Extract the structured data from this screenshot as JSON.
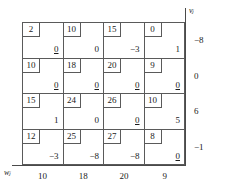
{
  "figure": {
    "type": "transportation-tableau",
    "rows": 4,
    "columns": 4
  },
  "axes": {
    "v_label": "vⱼ",
    "w_label": "wⱼ"
  },
  "chart_data": {
    "type": "table",
    "title": "",
    "xlabel": "wⱼ",
    "ylabel": "vⱼ",
    "grid": true,
    "legend": "none",
    "costs": [
      [
        2,
        10,
        15,
        0
      ],
      [
        10,
        18,
        20,
        9
      ],
      [
        15,
        24,
        26,
        10
      ],
      [
        12,
        25,
        27,
        8
      ]
    ],
    "values": [
      [
        "0",
        "0",
        "−3",
        "1"
      ],
      [
        "0",
        "0",
        "0",
        "0"
      ],
      [
        "1",
        "0",
        "0",
        "5"
      ],
      [
        "−3",
        "−8",
        "−8",
        "0"
      ]
    ],
    "basic": [
      [
        true,
        false,
        false,
        false
      ],
      [
        true,
        true,
        true,
        true
      ],
      [
        false,
        false,
        true,
        false
      ],
      [
        false,
        false,
        false,
        true
      ]
    ],
    "v": [
      "−8",
      "0",
      "6",
      "−1"
    ],
    "w": [
      "10",
      "18",
      "20",
      "9"
    ]
  },
  "cells": [
    [
      {
        "cost": "2",
        "value": "0",
        "basic": true
      },
      {
        "cost": "10",
        "value": "0",
        "basic": false
      },
      {
        "cost": "15",
        "value": "−3",
        "basic": false
      },
      {
        "cost": "0",
        "value": "1",
        "basic": false
      }
    ],
    [
      {
        "cost": "10",
        "value": "0",
        "basic": true
      },
      {
        "cost": "18",
        "value": "0",
        "basic": true
      },
      {
        "cost": "20",
        "value": "0",
        "basic": true
      },
      {
        "cost": "9",
        "value": "0",
        "basic": true
      }
    ],
    [
      {
        "cost": "15",
        "value": "1",
        "basic": false
      },
      {
        "cost": "24",
        "value": "0",
        "basic": false
      },
      {
        "cost": "26",
        "value": "0",
        "basic": true
      },
      {
        "cost": "10",
        "value": "5",
        "basic": false
      }
    ],
    [
      {
        "cost": "12",
        "value": "−3",
        "basic": false
      },
      {
        "cost": "25",
        "value": "−8",
        "basic": false
      },
      {
        "cost": "27",
        "value": "−8",
        "basic": false
      },
      {
        "cost": "8",
        "value": "0",
        "basic": true
      }
    ]
  ],
  "v_values": [
    "−8",
    "0",
    "6",
    "−1"
  ],
  "w_values": [
    "10",
    "18",
    "20",
    "9"
  ]
}
